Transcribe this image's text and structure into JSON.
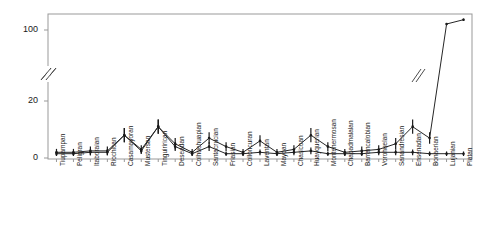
{
  "chart_data": {
    "type": "line",
    "title": "",
    "subtitle": "",
    "xlabel": "",
    "ylabel": "",
    "ylim": [
      0,
      170
    ],
    "y_ticks": [
      0,
      20,
      100
    ],
    "y_tick_labels": [
      "0",
      "20",
      "100"
    ],
    "y_axis_break": true,
    "y_axis_break_between": [
      20,
      100
    ],
    "grid": false,
    "legend": "none",
    "error_bars": true,
    "annotations": [
      {
        "name": "y-axis-break-symbol",
        "label": "//"
      },
      {
        "name": "line-break-symbol",
        "label": "//"
      }
    ],
    "categories": [
      "Tiupampan",
      "Peligran",
      "Itaboraian",
      "Riochican",
      "Casamayoran",
      "Mustersan",
      "Tinguirirican",
      "Deseadan",
      "Colhuehuapian",
      "Santacrucian",
      "Friasian",
      "Colloncuran",
      "Laventan",
      "Mayoan",
      "Chasicoan",
      "Huayquerian",
      "Montehermosan",
      "Chapadmalalan",
      "Barrancalobian",
      "Vorohuelan",
      "Sanandresian",
      "Ensenadan",
      "Bonaerian",
      "Lujanian",
      "Platan"
    ],
    "series": [
      {
        "name": "upper",
        "values": [
          2,
          2,
          2.5,
          2.5,
          8,
          3,
          11,
          5,
          2,
          7,
          4,
          2,
          6,
          2,
          3,
          8,
          4,
          2,
          2.5,
          3,
          5,
          11,
          7,
          135,
          160
        ],
        "errors": [
          1.2,
          1.2,
          1.5,
          1.5,
          2.5,
          1.5,
          2.5,
          2,
          1.2,
          2,
          1.5,
          1.2,
          2,
          1.2,
          1.5,
          2.5,
          1.5,
          1.2,
          1.5,
          1.5,
          2,
          2.5,
          2,
          6,
          7
        ]
      },
      {
        "name": "lower",
        "values": [
          1.5,
          1.5,
          2,
          2,
          8,
          2.5,
          11,
          4,
          1.5,
          4,
          1.5,
          1.5,
          2,
          1.5,
          2,
          2.5,
          1.5,
          1.5,
          1.5,
          2,
          2,
          2,
          1.5,
          1.5,
          1.5
        ],
        "errors": [
          0.8,
          0.8,
          1,
          1,
          2.5,
          1,
          2.5,
          1.5,
          0.8,
          1.5,
          0.8,
          0.8,
          1,
          0.8,
          1,
          1.2,
          0.8,
          0.8,
          0.8,
          1,
          1,
          1,
          0.8,
          0.8,
          0.8
        ]
      }
    ],
    "colors": {
      "line": "#262626",
      "marker": "#1a1a1a",
      "axis": "#999999",
      "text": "#1a1a1a"
    }
  }
}
